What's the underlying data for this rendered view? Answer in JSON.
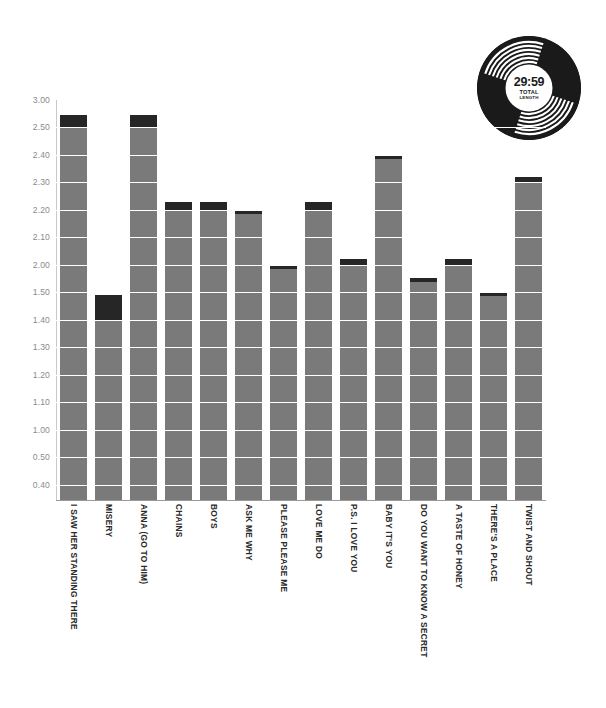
{
  "badge": {
    "name": "vinyl-record-badge",
    "time": "29:59",
    "caption_line1": "TOTAL",
    "caption_line2": "LENGTH",
    "disc_color": "#1a1a1a",
    "label_color": "#ffffff"
  },
  "chart_data": {
    "type": "bar",
    "title": "",
    "subtitle": "",
    "xlabel": "",
    "ylabel": "",
    "grid": true,
    "legend": "none",
    "bar_color": "#7a7a7a",
    "cap_color": "#262626",
    "ylim": [
      0.35,
      3.0
    ],
    "ytick_labels": [
      "3.00",
      "2.50",
      "2.40",
      "2.30",
      "2.20",
      "2.10",
      "2.00",
      "1.50",
      "1.40",
      "1.30",
      "1.20",
      "1.10",
      "1.00",
      "0.50",
      "0.40"
    ],
    "ytick_values": [
      3.0,
      2.5,
      2.4,
      2.3,
      2.2,
      2.1,
      2.0,
      1.5,
      1.4,
      1.3,
      1.2,
      1.1,
      1.0,
      0.5,
      0.4
    ],
    "categories": [
      "I SAW HER STANDING THERE",
      "MISERY",
      "ANNA (GO TO HIM)",
      "CHAINS",
      "BOYS",
      "ASK ME WHY",
      "PLEASE PLEASE ME",
      "LOVE ME DO",
      "P.S. I LOVE YOU",
      "BABY IT'S YOU",
      "DO YOU WANT TO KNOW A SECRET",
      "A TASTE OF HONEY",
      "THERE'S A PLACE",
      "TWIST AND SHOUT"
    ],
    "values": [
      2.72,
      1.49,
      2.72,
      2.23,
      2.23,
      2.2,
      2.0,
      2.23,
      2.02,
      2.4,
      1.77,
      2.02,
      1.51,
      2.32
    ],
    "cap_starts": [
      2.5,
      1.4,
      2.5,
      2.2,
      2.2,
      2.2,
      2.0,
      2.2,
      2.0,
      2.4,
      1.7,
      2.0,
      1.5,
      2.3
    ]
  }
}
